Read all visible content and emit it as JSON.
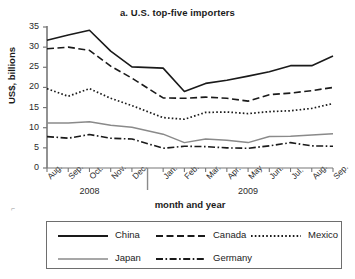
{
  "chart_data": {
    "type": "line",
    "title": "a. U.S. top-five importers",
    "xlabel": "month and year",
    "ylabel": "US$, billions",
    "ylim": [
      0,
      35
    ],
    "yticks": [
      0,
      5,
      10,
      15,
      20,
      25,
      30,
      35
    ],
    "grid": false,
    "legend_position": "bottom",
    "categories": [
      "Aug.",
      "Sep.",
      "Oct.",
      "Nov.",
      "Dec.",
      "Jan.",
      "Feb.",
      "Mar.",
      "Apr.",
      "May",
      "Jun.",
      "Jul.",
      "Aug.",
      "Sep."
    ],
    "group_labels": [
      "2008",
      "2009"
    ],
    "group_spans": [
      5,
      9
    ],
    "series": [
      {
        "name": "China",
        "style": "solid",
        "color": "#1a1a1a",
        "values": [
          31.7,
          33.0,
          34.2,
          29.0,
          25.1,
          24.8,
          19.0,
          21.0,
          21.8,
          22.8,
          23.9,
          25.4,
          25.4,
          27.8
        ]
      },
      {
        "name": "Canada",
        "style": "dashed",
        "color": "#1a1a1a",
        "values": [
          29.6,
          30.0,
          29.2,
          25.3,
          22.3,
          17.4,
          17.3,
          17.6,
          17.3,
          16.6,
          18.2,
          18.6,
          19.2,
          20.0
        ]
      },
      {
        "name": "Mexico",
        "style": "dotted",
        "color": "#1a1a1a",
        "values": [
          19.7,
          17.8,
          19.7,
          17.3,
          15.5,
          12.5,
          12.1,
          13.8,
          13.9,
          13.5,
          14.0,
          14.2,
          14.8,
          16.0
        ]
      },
      {
        "name": "Japan",
        "style": "solid-gray",
        "color": "#8a8a8a",
        "values": [
          11.2,
          11.2,
          11.5,
          10.6,
          10.1,
          8.4,
          6.3,
          7.2,
          6.9,
          6.3,
          7.8,
          7.9,
          8.2,
          8.5
        ]
      },
      {
        "name": "Germany",
        "style": "dashdot",
        "color": "#1a1a1a",
        "values": [
          7.8,
          7.4,
          8.3,
          7.4,
          7.2,
          4.9,
          5.4,
          5.3,
          5.0,
          4.9,
          5.5,
          6.3,
          5.5,
          5.4
        ]
      }
    ]
  },
  "legend": {
    "items": [
      {
        "label": "China"
      },
      {
        "label": "Canada"
      },
      {
        "label": "Mexico"
      },
      {
        "label": "Japan"
      },
      {
        "label": "Germany"
      }
    ]
  }
}
